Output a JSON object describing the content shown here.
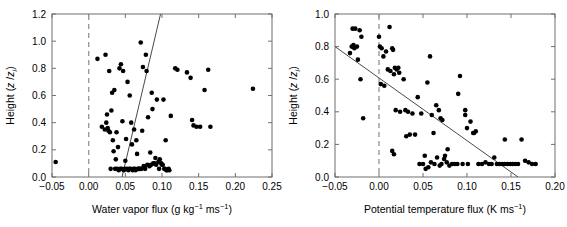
{
  "figure": {
    "background": "#ffffff",
    "marker_color": "#000000",
    "axis_color": "#6f6f6f",
    "zeroline_color": "#9a9a9a",
    "fitline_color": "#4a4a4a",
    "panels": [
      "left",
      "right"
    ]
  },
  "chart_data": [
    {
      "id": "left",
      "type": "scatter",
      "title": "",
      "xlabel": "Water vapor flux (g kg−1 ms−1)",
      "xlabel_parts": {
        "main": "Water vapor flux (g kg",
        "sup1": "−1",
        "mid": " ms",
        "sup2": "−1",
        "end": ")"
      },
      "ylabel": "Height (z /zᵢ)",
      "ylabel_parts": {
        "main": "Height (",
        "ital1": "z",
        "sep": " /",
        "ital2": "z",
        "sub": "i",
        "end": ")"
      },
      "xlim": [
        -0.05,
        0.25
      ],
      "ylim": [
        0.0,
        1.2
      ],
      "xticks": [
        -0.05,
        0.0,
        0.05,
        0.1,
        0.15,
        0.2,
        0.25
      ],
      "xticklabels": [
        "−0.05",
        "0.00",
        "0.05",
        "0.10",
        "0.15",
        "0.20",
        "0.25"
      ],
      "yticks": [
        0.0,
        0.2,
        0.4,
        0.6,
        0.8,
        1.0,
        1.2
      ],
      "yticklabels": [
        "0.0",
        "0.2",
        "0.4",
        "0.6",
        "0.8",
        "1.0",
        "1.2"
      ],
      "grid": false,
      "legend": "none",
      "reference_line": {
        "type": "vertical-dashed",
        "x": 0.0
      },
      "fit_line": {
        "type": "linear",
        "x0": 0.0455,
        "y0": 0.0,
        "x1": 0.098,
        "y1": 1.2
      },
      "x": [
        -0.045,
        0.012,
        0.023,
        0.028,
        0.032,
        0.035,
        0.071,
        0.074,
        0.031,
        0.042,
        0.044,
        0.047,
        0.053,
        0.056,
        0.058,
        0.062,
        0.065,
        0.078,
        0.079,
        0.086,
        0.026,
        0.038,
        0.046,
        0.051,
        0.059,
        0.066,
        0.073,
        0.081,
        0.087,
        0.093,
        0.102,
        0.105,
        0.112,
        0.118,
        0.121,
        0.134,
        0.139,
        0.141,
        0.143,
        0.147,
        0.152,
        0.158,
        0.163,
        0.166,
        0.224,
        0.018,
        0.022,
        0.027,
        0.029,
        0.033,
        0.036,
        0.039,
        0.041,
        0.043,
        0.045,
        0.048,
        0.049,
        0.052,
        0.054,
        0.055,
        0.057,
        0.06,
        0.061,
        0.063,
        0.064,
        0.067,
        0.068,
        0.069,
        0.07,
        0.072,
        0.075,
        0.076,
        0.077,
        0.08,
        0.083,
        0.085,
        0.088,
        0.09,
        0.092,
        0.095,
        0.097,
        0.099,
        0.101,
        0.104,
        0.107,
        0.034,
        0.037,
        0.04,
        0.05,
        0.084,
        0.03,
        0.024,
        0.025,
        0.091,
        0.096,
        0.1,
        0.103,
        0.106,
        0.109,
        0.11
      ],
      "y": [
        0.11,
        0.87,
        0.9,
        0.78,
        0.62,
        0.64,
        0.99,
        0.81,
        0.49,
        0.8,
        0.83,
        0.78,
        0.7,
        0.6,
        0.4,
        0.35,
        0.27,
        0.9,
        0.78,
        0.62,
        0.36,
        0.33,
        0.41,
        0.28,
        0.24,
        0.17,
        0.34,
        0.44,
        0.5,
        0.57,
        0.57,
        0.27,
        0.45,
        0.8,
        0.79,
        0.77,
        0.73,
        0.42,
        0.38,
        0.37,
        0.37,
        0.64,
        0.79,
        0.37,
        0.65,
        0.37,
        0.35,
        0.34,
        0.33,
        0.27,
        0.06,
        0.06,
        0.05,
        0.06,
        0.06,
        0.05,
        0.06,
        0.06,
        0.05,
        0.06,
        0.06,
        0.05,
        0.06,
        0.06,
        0.05,
        0.06,
        0.06,
        0.06,
        0.06,
        0.06,
        0.08,
        0.07,
        0.06,
        0.09,
        0.08,
        0.09,
        0.1,
        0.1,
        0.09,
        0.11,
        0.13,
        0.1,
        0.09,
        0.06,
        0.05,
        0.19,
        0.13,
        0.22,
        0.12,
        0.18,
        0.06,
        0.4,
        0.46,
        0.14,
        0.06,
        0.09,
        0.06,
        0.05,
        0.06,
        0.05
      ]
    },
    {
      "id": "right",
      "type": "scatter",
      "title": "",
      "xlabel": "Potential temperature flux (K ms−1)",
      "xlabel_parts": {
        "main": "Potential temperature flux (K ms",
        "sup1": "−1",
        "end": ")"
      },
      "ylabel": "Height (z /zᵢ)",
      "ylabel_parts": {
        "main": "Height (",
        "ital1": "z",
        "sep": " /",
        "ital2": "z",
        "sub": "i",
        "end": ")"
      },
      "xlim": [
        -0.05,
        0.2
      ],
      "ylim": [
        0.0,
        1.0
      ],
      "xticks": [
        -0.05,
        0.0,
        0.05,
        0.1,
        0.15,
        0.2
      ],
      "xticklabels": [
        "−0.05",
        "0.00",
        "0.05",
        "0.10",
        "0.15",
        "0.20"
      ],
      "yticks": [
        0.0,
        0.2,
        0.4,
        0.6,
        0.8,
        1.0
      ],
      "yticklabels": [
        "0.0",
        "0.2",
        "0.4",
        "0.6",
        "0.8",
        "1.0"
      ],
      "grid": false,
      "legend": "none",
      "reference_line": {
        "type": "vertical-dashed",
        "x": 0.0
      },
      "fit_line": {
        "type": "linear",
        "x0": -0.05,
        "y0": 0.8,
        "x1": 0.158,
        "y1": 0.0
      },
      "x": [
        -0.03,
        -0.027,
        -0.022,
        -0.02,
        -0.029,
        -0.028,
        -0.031,
        -0.025,
        -0.033,
        -0.024,
        -0.021,
        -0.018,
        0.0,
        0.001,
        0.003,
        0.005,
        0.008,
        0.012,
        0.015,
        0.016,
        0.018,
        0.02,
        0.022,
        0.023,
        0.002,
        0.006,
        0.01,
        0.013,
        0.017,
        0.019,
        0.024,
        0.028,
        0.03,
        0.033,
        0.035,
        0.038,
        0.041,
        0.044,
        0.048,
        0.052,
        0.055,
        0.058,
        0.06,
        0.062,
        0.065,
        0.068,
        0.07,
        0.072,
        0.075,
        0.078,
        0.053,
        0.056,
        0.059,
        0.063,
        0.066,
        0.069,
        0.071,
        0.074,
        0.077,
        0.08,
        0.083,
        0.086,
        0.089,
        0.092,
        0.095,
        0.098,
        0.101,
        0.104,
        0.107,
        0.11,
        0.113,
        0.117,
        0.121,
        0.125,
        0.128,
        0.131,
        0.134,
        0.137,
        0.14,
        0.143,
        0.146,
        0.149,
        0.152,
        0.155,
        0.158,
        0.162,
        0.166,
        0.17,
        0.174,
        0.178,
        0.015,
        0.017,
        0.09,
        0.098,
        0.1,
        0.108,
        0.143,
        0.05,
        0.046,
        0.031
      ],
      "y": [
        0.91,
        0.91,
        0.9,
        0.86,
        0.81,
        0.79,
        0.8,
        0.8,
        0.76,
        0.72,
        0.6,
        0.36,
        0.86,
        0.8,
        0.79,
        0.74,
        0.77,
        0.92,
        0.79,
        0.78,
        0.67,
        0.66,
        0.67,
        0.64,
        0.57,
        0.56,
        0.66,
        0.65,
        0.63,
        0.41,
        0.4,
        0.6,
        0.41,
        0.4,
        0.26,
        0.39,
        0.26,
        0.49,
        0.39,
        0.13,
        0.58,
        0.74,
        0.38,
        0.27,
        0.44,
        0.41,
        0.36,
        0.35,
        0.13,
        0.17,
        0.05,
        0.06,
        0.09,
        0.08,
        0.12,
        0.07,
        0.08,
        0.11,
        0.09,
        0.07,
        0.08,
        0.08,
        0.08,
        0.62,
        0.08,
        0.41,
        0.08,
        0.34,
        0.27,
        0.28,
        0.08,
        0.08,
        0.09,
        0.08,
        0.08,
        0.12,
        0.08,
        0.08,
        0.08,
        0.08,
        0.08,
        0.08,
        0.08,
        0.08,
        0.08,
        0.23,
        0.1,
        0.09,
        0.08,
        0.08,
        0.16,
        0.14,
        0.51,
        0.38,
        0.3,
        0.27,
        0.23,
        0.08,
        0.08,
        0.25
      ]
    }
  ]
}
